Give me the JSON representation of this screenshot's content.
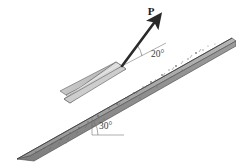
{
  "figure": {
    "background_color": "#ffffff",
    "force_label": "P",
    "force_angle_label": "20°",
    "incline_angle_label": "30°",
    "colors": {
      "block_face": "#d8d8d8",
      "block_face_shadow": "#bdbdbd",
      "block_side": "#cfcfcf",
      "block_edge": "#6f6f6f",
      "incline_top": "#a8a8a8",
      "incline_face": "#8d8d8d",
      "incline_edge": "#555555",
      "arrow": "#2a2a2a",
      "annotation_line": "#5a5a5a",
      "text": "#2b2b2b"
    },
    "geometry": {
      "incline_angle_deg": 30,
      "force_angle_from_incline_deg": 20,
      "arrow_tail": {
        "x": 122,
        "y": 66
      },
      "arrow_head": {
        "x": 156,
        "y": 21
      },
      "arrow_label_pos": {
        "x": 151,
        "y": 14
      },
      "force_angle_label_pos": {
        "x": 152,
        "y": 54
      },
      "incline_angle_label_pos": {
        "x": 101,
        "y": 126
      }
    },
    "speckles": [
      {
        "x": 196,
        "y": 53,
        "r": 1.0
      },
      {
        "x": 188,
        "y": 59,
        "r": 0.8
      },
      {
        "x": 203,
        "y": 50,
        "r": 0.7
      },
      {
        "x": 176,
        "y": 66,
        "r": 1.0
      },
      {
        "x": 169,
        "y": 70,
        "r": 0.7
      },
      {
        "x": 162,
        "y": 75,
        "r": 0.9
      },
      {
        "x": 182,
        "y": 70,
        "r": 0.6
      },
      {
        "x": 151,
        "y": 82,
        "r": 1.0
      },
      {
        "x": 143,
        "y": 87,
        "r": 0.7
      },
      {
        "x": 157,
        "y": 87,
        "r": 0.6
      },
      {
        "x": 134,
        "y": 93,
        "r": 0.9
      },
      {
        "x": 126,
        "y": 98,
        "r": 0.7
      },
      {
        "x": 140,
        "y": 98,
        "r": 0.6
      },
      {
        "x": 117,
        "y": 104,
        "r": 0.9
      },
      {
        "x": 109,
        "y": 109,
        "r": 0.7
      },
      {
        "x": 98,
        "y": 116,
        "r": 1.0
      },
      {
        "x": 88,
        "y": 122,
        "r": 0.8
      },
      {
        "x": 79,
        "y": 128,
        "r": 0.9
      },
      {
        "x": 70,
        "y": 133,
        "r": 0.7
      },
      {
        "x": 61,
        "y": 139,
        "r": 0.9
      },
      {
        "x": 52,
        "y": 144,
        "r": 0.7
      },
      {
        "x": 44,
        "y": 148,
        "r": 0.6
      },
      {
        "x": 36,
        "y": 152,
        "r": 0.8
      },
      {
        "x": 208,
        "y": 46,
        "r": 0.6
      },
      {
        "x": 215,
        "y": 44,
        "r": 0.5
      },
      {
        "x": 104,
        "y": 119,
        "r": 0.6
      },
      {
        "x": 93,
        "y": 126,
        "r": 0.6
      },
      {
        "x": 66,
        "y": 143,
        "r": 0.5
      },
      {
        "x": 28,
        "y": 156,
        "r": 0.5
      },
      {
        "x": 171,
        "y": 77,
        "r": 0.5
      }
    ],
    "tick_marks": [
      {
        "x1": 201,
        "y1": 49,
        "x2": 199,
        "y2": 52
      },
      {
        "x1": 192,
        "y1": 55,
        "x2": 190,
        "y2": 58
      },
      {
        "x1": 183,
        "y1": 61,
        "x2": 181,
        "y2": 64
      },
      {
        "x1": 174,
        "y1": 67,
        "x2": 172,
        "y2": 70
      },
      {
        "x1": 165,
        "y1": 73,
        "x2": 163,
        "y2": 76
      },
      {
        "x1": 156,
        "y1": 79,
        "x2": 154,
        "y2": 82
      },
      {
        "x1": 147,
        "y1": 85,
        "x2": 145,
        "y2": 88
      },
      {
        "x1": 138,
        "y1": 91,
        "x2": 136,
        "y2": 94
      },
      {
        "x1": 129,
        "y1": 97,
        "x2": 127,
        "y2": 100
      },
      {
        "x1": 120,
        "y1": 103,
        "x2": 118,
        "y2": 106
      },
      {
        "x1": 96,
        "y1": 119,
        "x2": 94,
        "y2": 122
      },
      {
        "x1": 87,
        "y1": 125,
        "x2": 85,
        "y2": 128
      },
      {
        "x1": 78,
        "y1": 131,
        "x2": 76,
        "y2": 134
      },
      {
        "x1": 69,
        "y1": 137,
        "x2": 67,
        "y2": 140
      },
      {
        "x1": 60,
        "y1": 142,
        "x2": 58,
        "y2": 145
      },
      {
        "x1": 51,
        "y1": 147,
        "x2": 49,
        "y2": 150
      }
    ]
  }
}
